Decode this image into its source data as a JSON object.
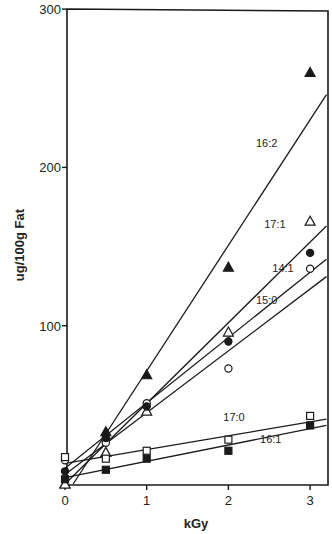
{
  "chart_data": {
    "type": "scatter",
    "title": "",
    "xlabel": "kGy",
    "ylabel": "ug/100g Fat",
    "xlim": [
      0,
      3.2
    ],
    "ylim": [
      0,
      300
    ],
    "x_ticks": [
      {
        "value": 0,
        "label": "0"
      },
      {
        "value": 1,
        "label": "1"
      },
      {
        "value": 2,
        "label": "2"
      },
      {
        "value": 3,
        "label": "3"
      }
    ],
    "y_ticks": [
      {
        "value": 100,
        "label": "100"
      },
      {
        "value": 200,
        "label": "200"
      },
      {
        "value": 300,
        "label": "300"
      }
    ],
    "grid": false,
    "legend": "inline labels on fit lines",
    "x": [
      0,
      0.5,
      1,
      2,
      3
    ],
    "series": [
      {
        "name": "16:2",
        "marker": "filled-triangle",
        "values": [
          0,
          33,
          69,
          137,
          260
        ],
        "fit": {
          "x0": 0.1,
          "y0": 0,
          "x1": 3.2,
          "y1": 246
        },
        "label_pos": {
          "x": 2.6,
          "y": 213
        }
      },
      {
        "name": "17:1",
        "marker": "open-triangle",
        "values": [
          0,
          20,
          46,
          96,
          166
        ],
        "fit": {
          "x0": 0,
          "y0": 0,
          "x1": 3.2,
          "y1": 163
        },
        "label_pos": {
          "x": 2.7,
          "y": 162
        }
      },
      {
        "name": "14:1",
        "marker": "open-circle",
        "values": [
          15,
          26,
          51,
          73,
          136
        ],
        "fit": {
          "x0": 0,
          "y0": 10,
          "x1": 3.2,
          "y1": 142
        },
        "label_pos": {
          "x": 2.8,
          "y": 134
        }
      },
      {
        "name": "15:0",
        "marker": "filled-circle",
        "values": [
          8,
          29,
          49,
          90,
          146
        ],
        "fit": {
          "x0": 0,
          "y0": 6,
          "x1": 3.2,
          "y1": 131
        },
        "label_pos": {
          "x": 2.6,
          "y": 114
        }
      },
      {
        "name": "17:0",
        "marker": "open-square",
        "values": [
          17,
          16,
          21,
          28,
          43
        ],
        "fit": {
          "x0": 0,
          "y0": 13,
          "x1": 3.2,
          "y1": 41
        },
        "label_pos": {
          "x": 2.2,
          "y": 40
        }
      },
      {
        "name": "16:1",
        "marker": "filled-square",
        "values": [
          3,
          9,
          16,
          21,
          37
        ],
        "fit": {
          "x0": 0,
          "y0": 4,
          "x1": 3.2,
          "y1": 37
        },
        "label_pos": {
          "x": 2.65,
          "y": 26
        }
      }
    ]
  },
  "colors": {
    "ink": "#1a1a1a",
    "background": "#ffffff"
  }
}
